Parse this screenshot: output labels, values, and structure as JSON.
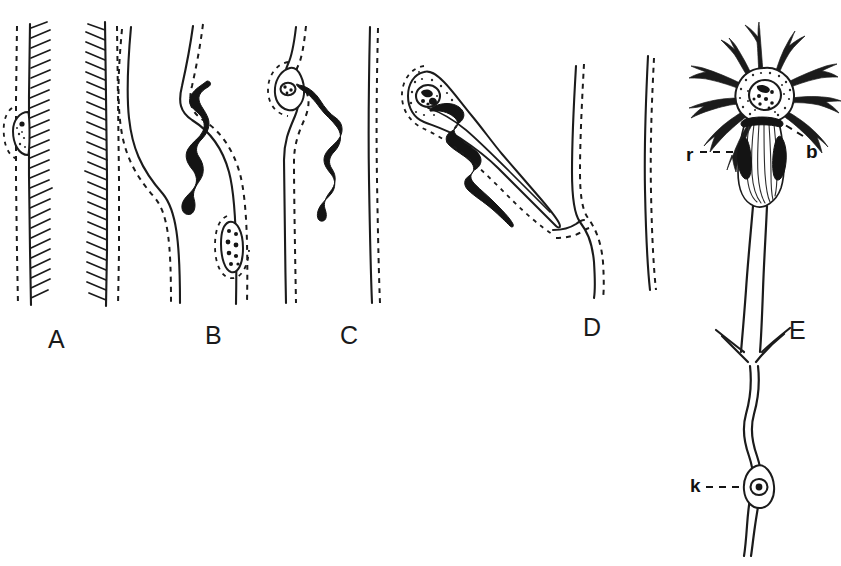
{
  "figure": {
    "kind": "scientific-line-drawing",
    "background_color": "#ffffff",
    "ink_color": "#1b1b1b",
    "width": 841,
    "height": 566,
    "panel_letters": [
      {
        "label": "A",
        "x": 48,
        "y": 327
      },
      {
        "label": "B",
        "x": 205,
        "y": 323
      },
      {
        "label": "C",
        "x": 340,
        "y": 323
      },
      {
        "label": "D",
        "x": 583,
        "y": 315
      },
      {
        "label": "E",
        "x": 789,
        "y": 318
      }
    ],
    "callouts": [
      {
        "label": "r",
        "x": 686,
        "y": 145
      },
      {
        "label": "b",
        "x": 806,
        "y": 142
      },
      {
        "label": "k",
        "x": 690,
        "y": 476
      }
    ],
    "panels": [
      {
        "id": "A",
        "letter": "A",
        "description": "Two hatched vessel walls with dashed outer membranes; a small elongated stippled cell on the outer face of the left wall."
      },
      {
        "id": "B",
        "letter": "B",
        "description": "Two wavy vessel walls with dashed outlines; a thick black serpentine body crossing the wall above, and a granule-filled cell applied to the wall below."
      },
      {
        "id": "C",
        "letter": "C",
        "description": "Vessel wall with a cell body at the bend from which a black serpentine process descends; a second plain dashed wall at the right."
      },
      {
        "id": "D",
        "letter": "D",
        "description": "Large stippled cell with nucleus; its long tapering process contains a black serpentine inclusion and reaches a bent vessel wall."
      },
      {
        "id": "E",
        "letter": "E",
        "description": "Multipolar neuron with stippled soma, dark branching dendrites, striated axon hillock flanked by two dark bodies (r), a dendrite marked b, and a long axon bearing a nucleated cell (k)."
      }
    ]
  }
}
